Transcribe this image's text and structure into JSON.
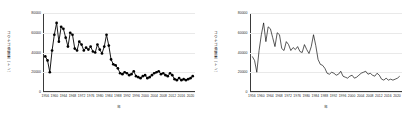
{
  "figure": {
    "panels": [
      {
        "key": "left",
        "ylabel": "コウナゴ漁獲量（トン）",
        "xlabel": "年",
        "marker": "circle"
      },
      {
        "key": "right",
        "ylabel": "コウナゴ漁獲量（トン）",
        "xlabel": "年",
        "marker": "none"
      }
    ]
  },
  "chart_data": {
    "type": "line",
    "title": "",
    "xlabel": "年",
    "ylabel": "コウナゴ漁獲量（トン）",
    "xlim": [
      1955,
      2022
    ],
    "ylim": [
      0,
      80000
    ],
    "grid": true,
    "legend": false,
    "yticks": [
      0,
      20000,
      40000,
      60000,
      80000
    ],
    "ytick_labels": [
      "0",
      "20000",
      "40000",
      "60000",
      "80000"
    ],
    "xticks": [
      1956,
      1960,
      1964,
      1968,
      1972,
      1976,
      1980,
      1984,
      1988,
      1992,
      1996,
      2000,
      2004,
      2008,
      2012,
      2016,
      2020
    ],
    "xtick_labels": [
      "1956",
      "1960",
      "1964",
      "1968",
      "1972",
      "1976",
      "1980",
      "1984",
      "1988",
      "1992",
      "1996",
      "2000",
      "2004",
      "2008",
      "2012",
      "2016",
      "2020"
    ],
    "series": [
      {
        "name": "コウナゴ漁獲量",
        "color": "#000000",
        "x": [
          1956,
          1957,
          1958,
          1959,
          1960,
          1961,
          1962,
          1963,
          1964,
          1965,
          1966,
          1967,
          1968,
          1969,
          1970,
          1971,
          1972,
          1973,
          1974,
          1975,
          1976,
          1977,
          1978,
          1979,
          1980,
          1981,
          1982,
          1983,
          1984,
          1985,
          1986,
          1987,
          1988,
          1989,
          1990,
          1991,
          1992,
          1993,
          1994,
          1995,
          1996,
          1997,
          1998,
          1999,
          2000,
          2001,
          2002,
          2003,
          2004,
          2005,
          2006,
          2007,
          2008,
          2009,
          2010,
          2011,
          2012,
          2013,
          2014,
          2015,
          2016,
          2017,
          2018,
          2019,
          2020,
          2021
        ],
        "values": [
          36000,
          32000,
          20000,
          42000,
          58000,
          70000,
          51000,
          66000,
          64000,
          55000,
          46000,
          60000,
          58000,
          44000,
          42000,
          51000,
          48000,
          42000,
          45000,
          43000,
          46000,
          41000,
          40000,
          48000,
          43000,
          39000,
          46000,
          58000,
          47000,
          33000,
          28000,
          27000,
          24000,
          19000,
          18000,
          20000,
          19000,
          17000,
          18000,
          21000,
          16000,
          15000,
          14000,
          16000,
          17000,
          14000,
          15000,
          17000,
          19000,
          20000,
          21000,
          18000,
          19000,
          17000,
          16000,
          19000,
          17000,
          13000,
          12000,
          14000,
          12000,
          13000,
          12000,
          13000,
          14000,
          16000
        ]
      }
    ]
  }
}
